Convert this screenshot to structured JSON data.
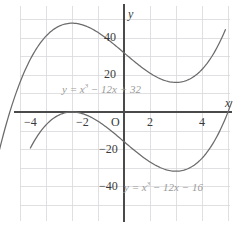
{
  "figure": {
    "background_color": "#ffffff",
    "grid_color": "#d8d8dc",
    "axis_color": "#4a4a4a",
    "curve_color": "#6b6b6b",
    "label_color": "#3a3a3a",
    "equation_color": "#9a9a9a"
  },
  "axes": {
    "x_axis_name": "x",
    "y_axis_name": "y",
    "origin_label": "O",
    "x_tick_labels": [
      "−4",
      "−2",
      "2",
      "4"
    ],
    "y_tick_labels": [
      "40",
      "20",
      "−20",
      "−40"
    ]
  },
  "equations": {
    "upper": {
      "lhs": "y = x",
      "exponent": "3",
      "rhs": " − 12x + 32",
      "full": "y = x³ − 12x + 32"
    },
    "lower": {
      "lhs": "y = x",
      "exponent": "3",
      "rhs": " − 12x − 16",
      "full": "y = x³ − 12x − 16"
    }
  },
  "chart_data": {
    "type": "line",
    "title": "",
    "xlabel": "x",
    "ylabel": "y",
    "xlim": [
      -4.85,
      4.15
    ],
    "ylim": [
      -52,
      55
    ],
    "grid": true,
    "x_ticks": [
      -4,
      -2,
      2,
      4
    ],
    "y_ticks": [
      40,
      20,
      -20,
      -40
    ],
    "legend": "inline-annotations",
    "series": [
      {
        "name": "y = x³ − 12x + 32",
        "color": "#6b6b6b",
        "coefficients": {
          "a": 1,
          "b": 0,
          "c": -12,
          "d": 32
        },
        "local_max": {
          "x": -2,
          "y": 48
        },
        "local_min": {
          "x": 2,
          "y": 16
        },
        "x": [
          -4.85,
          -4.5,
          -4,
          -3.5,
          -3,
          -2.5,
          -2,
          -1.5,
          -1,
          -0.5,
          0,
          0.5,
          1,
          1.5,
          2,
          2.5,
          3,
          3.5,
          3.9
        ],
        "y": [
          -23.9,
          -5.1,
          16,
          31.1,
          41,
          46.4,
          48,
          46.6,
          43,
          37.9,
          32,
          26.1,
          21,
          17.4,
          16,
          17.6,
          23,
          33.1,
          44.5
        ]
      },
      {
        "name": "y = x³ − 12x − 16",
        "color": "#6b6b6b",
        "coefficients": {
          "a": 1,
          "b": 0,
          "c": -12,
          "d": -16
        },
        "local_max": {
          "x": -2,
          "y": 0
        },
        "local_min": {
          "x": 2,
          "y": -32
        },
        "x": [
          -3.6,
          -3.2,
          -3,
          -2.5,
          -2,
          -1.5,
          -1,
          -0.5,
          0,
          0.5,
          1,
          1.5,
          2,
          2.5,
          3,
          3.5,
          4,
          4.15
        ],
        "y": [
          -19.5,
          -10.3,
          -7,
          -1.6,
          0,
          -1.4,
          -5,
          -10.1,
          -16,
          -21.9,
          -27,
          -30.6,
          -32,
          -30.4,
          -25,
          -15.1,
          0,
          5.7
        ]
      }
    ]
  }
}
